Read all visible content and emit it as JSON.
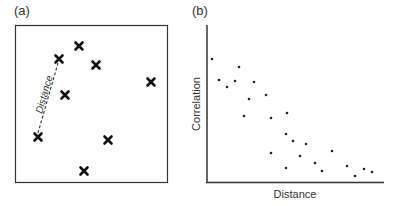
{
  "panel_a": {
    "label": "(a)",
    "distance_label": "Distance",
    "points": [
      [
        79,
        46
      ],
      [
        59,
        59
      ],
      [
        96,
        65
      ],
      [
        151,
        82
      ],
      [
        65,
        95
      ],
      [
        38,
        137
      ],
      [
        108,
        140
      ],
      [
        84,
        171
      ]
    ],
    "distance_line": {
      "from": [
        38,
        133
      ],
      "to": [
        58,
        63
      ]
    }
  },
  "panel_b": {
    "label": "(b)",
    "xlabel": "Distance",
    "ylabel": "Correlation"
  },
  "chart_data": {
    "type": "scatter",
    "title": "",
    "xlabel": "Distance",
    "ylabel": "Correlation",
    "grid": false,
    "ticks": "none",
    "points_px": [
      [
        212,
        59
      ],
      [
        219,
        80
      ],
      [
        227,
        87
      ],
      [
        235,
        81
      ],
      [
        239,
        67
      ],
      [
        254,
        82
      ],
      [
        249,
        99
      ],
      [
        266,
        95
      ],
      [
        244,
        116
      ],
      [
        271,
        118
      ],
      [
        287,
        113
      ],
      [
        286,
        134
      ],
      [
        293,
        141
      ],
      [
        306,
        144
      ],
      [
        271,
        153
      ],
      [
        300,
        156
      ],
      [
        332,
        151
      ],
      [
        315,
        163
      ],
      [
        286,
        168
      ],
      [
        322,
        171
      ],
      [
        347,
        166
      ],
      [
        355,
        176
      ],
      [
        364,
        169
      ],
      [
        372,
        172
      ]
    ],
    "trend": "negative"
  }
}
